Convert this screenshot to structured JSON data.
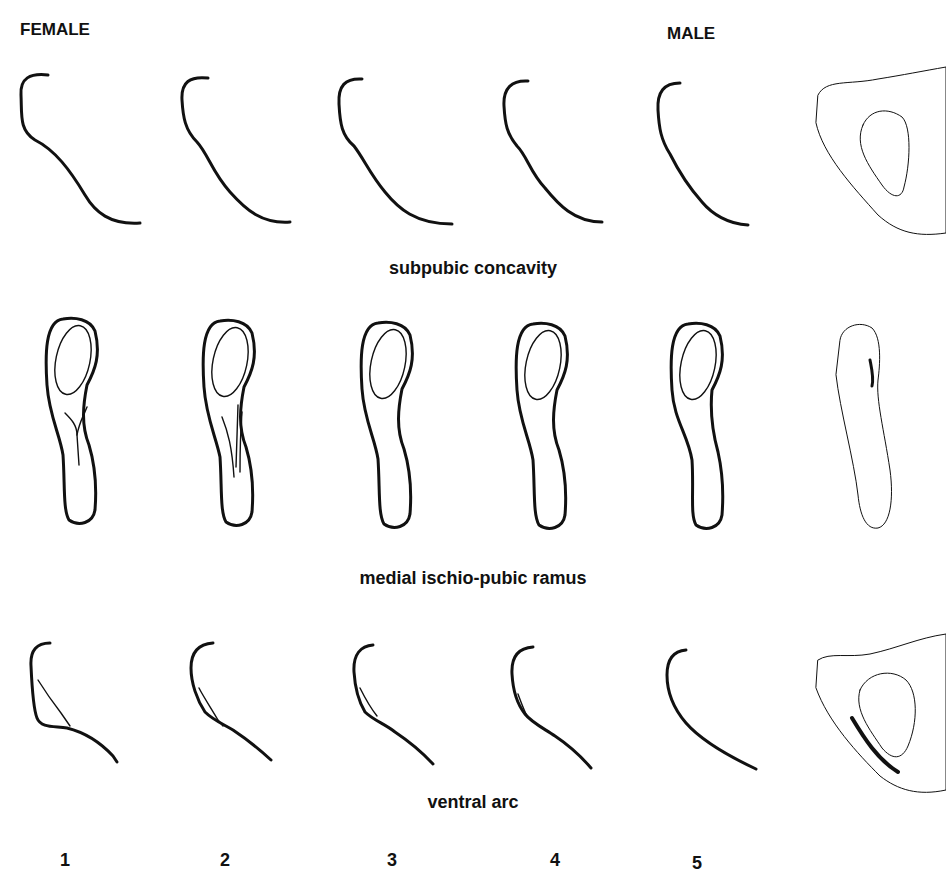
{
  "figure": {
    "headers": {
      "female": "FEMALE",
      "male": "MALE"
    },
    "rows": [
      {
        "id": "subpubic-concavity",
        "label": "subpubic concavity"
      },
      {
        "id": "medial-ischio-pubic-ramus",
        "label": "medial ischio-pubic ramus"
      },
      {
        "id": "ventral-arc",
        "label": "ventral arc"
      }
    ],
    "scores": [
      "1",
      "2",
      "3",
      "4",
      "5"
    ],
    "colors": {
      "line": "#111111",
      "model_fill": "#a8a8a8",
      "background": "#ffffff"
    }
  }
}
